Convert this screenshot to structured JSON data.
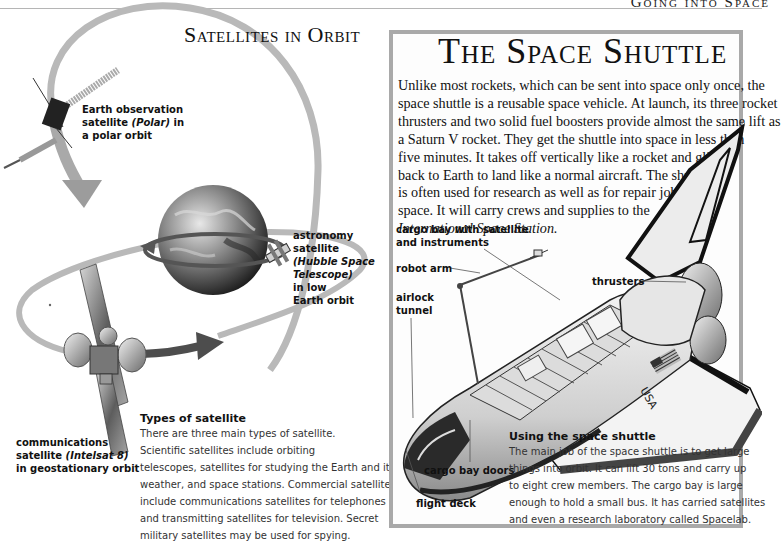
{
  "page": {
    "running_head": "Going into Space"
  },
  "satellites": {
    "heading": "Satellites in Orbit",
    "labels": {
      "polar": {
        "line1": "Earth observation",
        "line2_pre": "satellite ",
        "line2_italic": "(Polar)",
        "line2_post": " in",
        "line3": "a polar orbit"
      },
      "hubble": {
        "line1": "astronomy",
        "line2": "satellite",
        "line3_italic": "(Hubble Space",
        "line4_italic": "Telescope)",
        "line5": "in low",
        "line6": "Earth orbit"
      },
      "intelsat": {
        "line1": "communications",
        "line2_pre": "satellite ",
        "line2_italic": "(Intelsat 8)",
        "line3": "in geostationary orbit"
      }
    },
    "types": {
      "heading": "Types of satellite",
      "lines": [
        "There are three main types of satellite.",
        "Scientific satellites include orbiting",
        "telescopes, satellites for studying the Earth and its",
        "weather, and space stations. Commercial satellites",
        "include communications satellites for telephones",
        "and transmitting satellites for television. Secret",
        "military satellites may be used for spying."
      ]
    }
  },
  "shuttle": {
    "title": "The Space Shuttle",
    "intro_lines": [
      "Unlike most rockets, which can be sent into space only once, the",
      "space shuttle is a reusable space vehicle. At launch, its three rocket",
      "thrusters and two solid fuel boosters provide almost the same lift as",
      "a Saturn V rocket. They get the shuttle into space in less than",
      "five minutes. It takes off vertically like a rocket and glides",
      "back to Earth to land like a normal aircraft. The shuttle",
      "is often used for research as well as for repair jobs in",
      "space. It will carry crews and supplies to the"
    ],
    "intro_italic": "International Space Station.",
    "labels": {
      "cargo_bay_1": "cargo bay with satellite",
      "cargo_bay_2": "and instruments",
      "thrusters": "thrusters",
      "robot_arm": "robot arm",
      "airlock_1": "airlock",
      "airlock_2": "tunnel",
      "cargo_doors": "cargo bay doors",
      "flight_deck": "flight deck",
      "usa": "USA"
    },
    "using": {
      "heading": "Using the space shuttle",
      "lines": [
        "The main job of the space shuttle is to get large",
        "things into orbit. It can lift 30 tons and carry up",
        "to eight crew members. The cargo bay is large",
        "enough to hold a small bus. It has carried satellites",
        "and even a research laboratory called Spacelab."
      ]
    }
  },
  "colors": {
    "panel_border": "#a9a9a9",
    "orbit_light": "#b4b4b4",
    "orbit_dark": "#5a5a5a",
    "text": "#111111"
  }
}
